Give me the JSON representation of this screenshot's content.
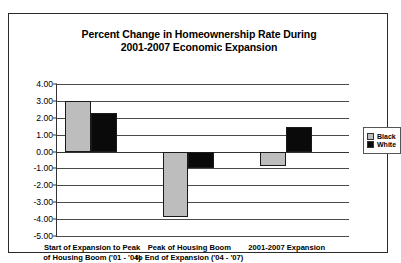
{
  "chart_data": {
    "type": "bar",
    "title": "Percent Change in Homeownership Rate During 2001-2007 Economic Expansion",
    "title_line1": "Percent Change in Homeownership Rate During",
    "title_line2": "2001-2007 Economic Expansion",
    "xlabel": "",
    "ylabel": "",
    "ylim": [
      -5.0,
      4.0
    ],
    "ytick_labels": [
      "4.00",
      "3.00",
      "2.00",
      "1.00",
      "0.00",
      "-1.00",
      "-2.00",
      "-3.00",
      "-4.00",
      "-5.00"
    ],
    "ytick_values": [
      4.0,
      3.0,
      2.0,
      1.0,
      0.0,
      -1.0,
      -2.0,
      -3.0,
      -4.0,
      -5.0
    ],
    "grid": true,
    "legend_position": "right",
    "categories": [
      "Start of Expansion to Peak of Housing Boom ('01 - '04)",
      "Peak of Housing Boom to End of Expansion ('04 - '07)",
      "2001-2007 Expansion"
    ],
    "category_lines": [
      [
        "Start of Expansion to Peak",
        "of Housing Boom ('01 - '04)"
      ],
      [
        "Peak of Housing Boom",
        "to End of Expansion ('04 - '07)"
      ],
      [
        "2001-2007 Expansion",
        ""
      ]
    ],
    "series": [
      {
        "name": "Black",
        "color": "#bdbdbd",
        "values": [
          3.0,
          -3.85,
          -0.85
        ]
      },
      {
        "name": "White",
        "color": "#0a0a0a",
        "values": [
          2.3,
          -0.95,
          1.45
        ]
      }
    ]
  },
  "legend": {
    "items": [
      {
        "label": "Black",
        "color": "#bdbdbd"
      },
      {
        "label": "White",
        "color": "#0a0a0a"
      }
    ]
  }
}
